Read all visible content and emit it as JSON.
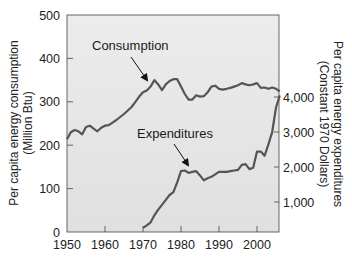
{
  "chart_data": {
    "type": "line",
    "title": "",
    "xlabel": "",
    "x_ticks": [
      1950,
      1960,
      1970,
      1980,
      1990,
      2000
    ],
    "xlim": [
      1950,
      2006
    ],
    "left_axis": {
      "label_line1": "Per capita energy consumption",
      "label_line2": "(Million Btu)",
      "ticks": [
        "0",
        "100",
        "200",
        "300",
        "400",
        "500"
      ],
      "ylim": [
        0,
        500
      ]
    },
    "right_axis": {
      "label_line1": "Per capita energy expenditures",
      "label_line2": "(Constant 1970 Dollars)",
      "ticks": [
        "1,000",
        "2,000",
        "3,000",
        "4,000"
      ]
    },
    "grid": false,
    "legend": "none (inline annotations with arrows)",
    "annotations": {
      "consumption": "Consumption",
      "expenditures": "Expenditures"
    },
    "series": [
      {
        "name": "Consumption",
        "axis": "left",
        "unit": "Million Btu",
        "x": [
          1950,
          1951,
          1952,
          1953,
          1954,
          1955,
          1956,
          1957,
          1958,
          1959,
          1960,
          1961,
          1962,
          1963,
          1964,
          1965,
          1966,
          1967,
          1968,
          1969,
          1970,
          1971,
          1972,
          1973,
          1974,
          1975,
          1976,
          1977,
          1978,
          1979,
          1980,
          1981,
          1982,
          1983,
          1984,
          1985,
          1986,
          1987,
          1988,
          1989,
          1990,
          1991,
          1992,
          1993,
          1994,
          1995,
          1996,
          1997,
          1998,
          1999,
          2000,
          2001,
          2002,
          2003,
          2004,
          2005,
          2006
        ],
        "values": [
          214,
          230,
          235,
          232,
          225,
          242,
          245,
          238,
          232,
          240,
          245,
          246,
          252,
          258,
          265,
          272,
          280,
          288,
          300,
          312,
          322,
          326,
          335,
          350,
          340,
          327,
          340,
          348,
          352,
          352,
          335,
          318,
          305,
          305,
          315,
          312,
          313,
          322,
          335,
          337,
          330,
          328,
          330,
          332,
          335,
          338,
          343,
          340,
          338,
          340,
          343,
          332,
          333,
          330,
          333,
          330,
          324
        ]
      },
      {
        "name": "Expenditures",
        "axis": "right",
        "unit": "Constant 1970 Dollars",
        "x": [
          1970,
          1971,
          1972,
          1973,
          1974,
          1975,
          1976,
          1977,
          1978,
          1979,
          1980,
          1981,
          1982,
          1983,
          1984,
          1985,
          1986,
          1987,
          1988,
          1989,
          1990,
          1991,
          1992,
          1993,
          1994,
          1995,
          1996,
          1997,
          1998,
          1999,
          2000,
          2001,
          2002,
          2003,
          2004,
          2005,
          2006
        ],
        "values": [
          260,
          330,
          420,
          620,
          780,
          920,
          1060,
          1200,
          1280,
          1560,
          1880,
          1900,
          1830,
          1860,
          1880,
          1760,
          1620,
          1680,
          1720,
          1790,
          1860,
          1860,
          1860,
          1880,
          1900,
          1920,
          2060,
          2080,
          1940,
          1980,
          2440,
          2440,
          2320,
          2650,
          3000,
          3700,
          4050
        ]
      }
    ],
    "colors": {
      "plot_background": "#e6e6e6",
      "line": "#555555",
      "axis": "#333333",
      "text": "#222222"
    }
  }
}
